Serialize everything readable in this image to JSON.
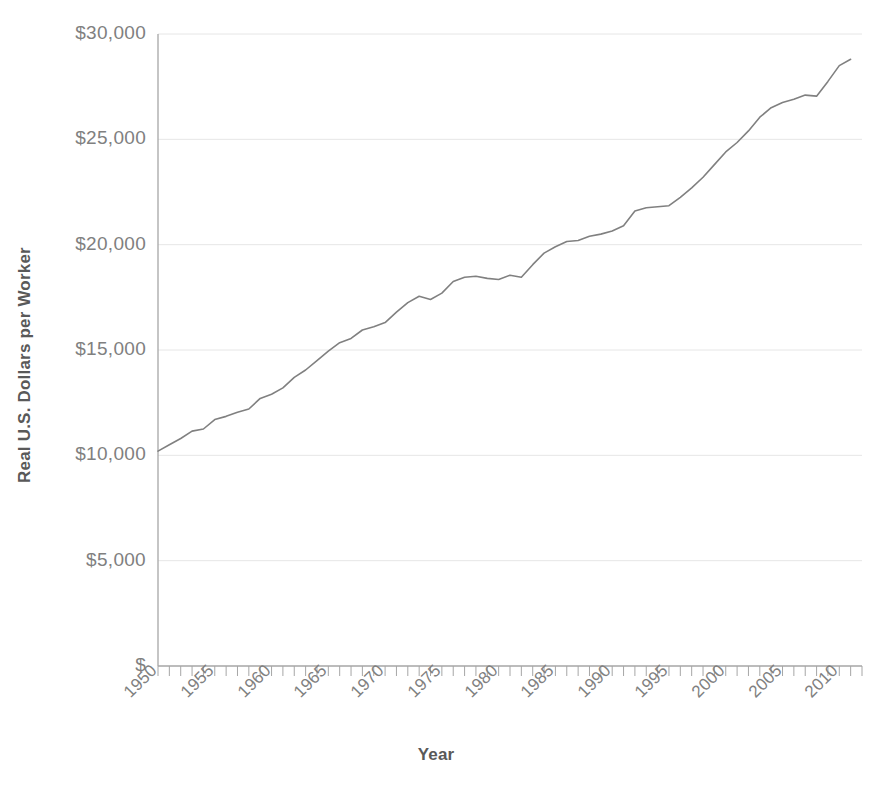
{
  "chart_data": {
    "type": "line",
    "title": "",
    "subtitle": "",
    "xlabel": "Year",
    "ylabel": "Real U.S. Dollars per Worker",
    "xlim": [
      1950,
      2012
    ],
    "ylim": [
      0,
      30000
    ],
    "grid": true,
    "grid_axis": "y",
    "legend": "none",
    "line_color": "#808080",
    "text_color": "#595959",
    "grid_color": "#e6e6e6",
    "axis_color": "#a6a6a6",
    "ytick_labels": [
      "$",
      "$5,000",
      "$10,000",
      "$15,000",
      "$20,000",
      "$25,000",
      "$30,000"
    ],
    "ytick_values": [
      0,
      5000,
      10000,
      15000,
      20000,
      25000,
      30000
    ],
    "xtick_labels": [
      "1950",
      "1955",
      "1960",
      "1965",
      "1970",
      "1975",
      "1980",
      "1985",
      "1990",
      "1995",
      "2000",
      "2005",
      "2010"
    ],
    "xtick_values": [
      1950,
      1955,
      1960,
      1965,
      1970,
      1975,
      1980,
      1985,
      1990,
      1995,
      2000,
      2005,
      2010
    ],
    "xtick_minor_step": 1,
    "x": [
      1950,
      1951,
      1952,
      1953,
      1954,
      1955,
      1956,
      1957,
      1958,
      1959,
      1960,
      1961,
      1962,
      1963,
      1964,
      1965,
      1966,
      1967,
      1968,
      1969,
      1970,
      1971,
      1972,
      1973,
      1974,
      1975,
      1976,
      1977,
      1978,
      1979,
      1980,
      1981,
      1982,
      1983,
      1984,
      1985,
      1986,
      1987,
      1988,
      1989,
      1990,
      1991,
      1992,
      1993,
      1994,
      1995,
      1996,
      1997,
      1998,
      1999,
      2000,
      2001,
      2002,
      2003,
      2004,
      2005,
      2006,
      2007,
      2008,
      2009,
      2010,
      2011
    ],
    "values": [
      10200,
      10500,
      10800,
      11150,
      11250,
      11700,
      11850,
      12050,
      12200,
      12700,
      12900,
      13200,
      13700,
      14050,
      14500,
      14950,
      15350,
      15550,
      15950,
      16100,
      16300,
      16800,
      17250,
      17550,
      17400,
      17700,
      18250,
      18450,
      18500,
      18400,
      18350,
      18550,
      18450,
      19050,
      19600,
      19900,
      20150,
      20200,
      20400,
      20500,
      20650,
      20900,
      21600,
      21750,
      21800,
      21850,
      22250,
      22700,
      23200,
      23800,
      24400,
      24850,
      25400,
      26050,
      26500,
      26750,
      26900,
      27100,
      27050,
      27750,
      28500,
      28800
    ],
    "series_name": "Real output per worker",
    "annotations": []
  }
}
